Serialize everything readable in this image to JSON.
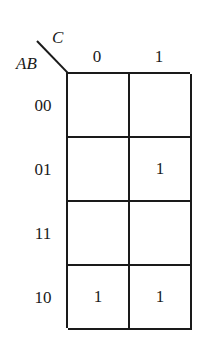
{
  "kmap": {
    "row_variable": "AB",
    "col_variable": "C",
    "col_labels": [
      "0",
      "1"
    ],
    "rows": [
      {
        "label": "00",
        "cells": [
          "",
          ""
        ]
      },
      {
        "label": "01",
        "cells": [
          "",
          "1"
        ]
      },
      {
        "label": "11",
        "cells": [
          "",
          ""
        ]
      },
      {
        "label": "10",
        "cells": [
          "1",
          "1"
        ]
      }
    ]
  }
}
